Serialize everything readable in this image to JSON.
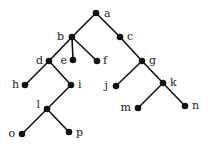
{
  "diagram": {
    "type": "tree",
    "nodes": [
      {
        "id": "a",
        "label": "a",
        "x": 96,
        "y": 13,
        "lx": 104,
        "ly": 17,
        "anchor": "start"
      },
      {
        "id": "b",
        "label": "b",
        "x": 72,
        "y": 37,
        "lx": 64,
        "ly": 40,
        "anchor": "end"
      },
      {
        "id": "c",
        "label": "c",
        "x": 120,
        "y": 37,
        "lx": 127,
        "ly": 40,
        "anchor": "start"
      },
      {
        "id": "d",
        "label": "d",
        "x": 49,
        "y": 61,
        "lx": 43,
        "ly": 64,
        "anchor": "end"
      },
      {
        "id": "e",
        "label": "e",
        "x": 73,
        "y": 60,
        "lx": 67,
        "ly": 64,
        "anchor": "end"
      },
      {
        "id": "f",
        "label": "f",
        "x": 97,
        "y": 61,
        "lx": 103,
        "ly": 64,
        "anchor": "start"
      },
      {
        "id": "g",
        "label": "g",
        "x": 142,
        "y": 61,
        "lx": 149,
        "ly": 64,
        "anchor": "start"
      },
      {
        "id": "h",
        "label": "h",
        "x": 25,
        "y": 85,
        "lx": 19,
        "ly": 88,
        "anchor": "end"
      },
      {
        "id": "i",
        "label": "i",
        "x": 71,
        "y": 85,
        "lx": 78,
        "ly": 88,
        "anchor": "start"
      },
      {
        "id": "j",
        "label": "j",
        "x": 116,
        "y": 86,
        "lx": 108,
        "ly": 89,
        "anchor": "end"
      },
      {
        "id": "k",
        "label": "k",
        "x": 163,
        "y": 83,
        "lx": 170,
        "ly": 86,
        "anchor": "start"
      },
      {
        "id": "l",
        "label": "l",
        "x": 47,
        "y": 109,
        "lx": 40,
        "ly": 108,
        "anchor": "end"
      },
      {
        "id": "m",
        "label": "m",
        "x": 138,
        "y": 108,
        "lx": 131,
        "ly": 111,
        "anchor": "end"
      },
      {
        "id": "n",
        "label": "n",
        "x": 185,
        "y": 106,
        "lx": 192,
        "ly": 109,
        "anchor": "start"
      },
      {
        "id": "o",
        "label": "o",
        "x": 22,
        "y": 134,
        "lx": 15,
        "ly": 137,
        "anchor": "end"
      },
      {
        "id": "p",
        "label": "p",
        "x": 69,
        "y": 132,
        "lx": 76,
        "ly": 136,
        "anchor": "start"
      }
    ],
    "edges": [
      [
        "a",
        "b"
      ],
      [
        "a",
        "c"
      ],
      [
        "b",
        "d"
      ],
      [
        "b",
        "e"
      ],
      [
        "b",
        "f"
      ],
      [
        "c",
        "g"
      ],
      [
        "d",
        "h"
      ],
      [
        "d",
        "i"
      ],
      [
        "g",
        "j"
      ],
      [
        "g",
        "k"
      ],
      [
        "i",
        "l"
      ],
      [
        "k",
        "m"
      ],
      [
        "k",
        "n"
      ],
      [
        "l",
        "o"
      ],
      [
        "l",
        "p"
      ]
    ]
  }
}
